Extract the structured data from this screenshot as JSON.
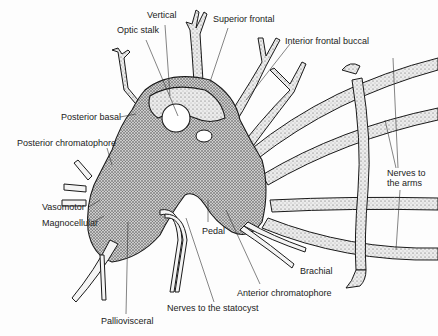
{
  "diagram": {
    "colors": {
      "ink": "#1a1a1a",
      "fill": "#d8d8d8",
      "nerve_fill": "#e6e6e6",
      "background": "#fdfdfd"
    },
    "labels": [
      {
        "id": "vertical",
        "text": "Vertical",
        "x": 147,
        "y": 15
      },
      {
        "id": "superior-frontal",
        "text": "Superior frontal",
        "x": 213,
        "y": 19
      },
      {
        "id": "optic-stalk",
        "text": "Optic stalk",
        "x": 117,
        "y": 30
      },
      {
        "id": "interior-frontal-buccal",
        "text": "Interior frontal buccal",
        "x": 285,
        "y": 37
      },
      {
        "id": "posterior-basal",
        "text": "Posterior basal",
        "x": 61,
        "y": 113
      },
      {
        "id": "posterior-chromatophore",
        "text": "Posterior chromatophore",
        "x": 17,
        "y": 138
      },
      {
        "id": "nerves-to-the-arms",
        "text": "Nerves to\nthe arms",
        "x": 387,
        "y": 168
      },
      {
        "id": "vasomotor",
        "text": "Vasomotor",
        "x": 42,
        "y": 204
      },
      {
        "id": "magnocellular",
        "text": "Magnocellular",
        "x": 42,
        "y": 219
      },
      {
        "id": "pedal",
        "text": "Pedal",
        "x": 202,
        "y": 225
      },
      {
        "id": "brachial",
        "text": "Brachial",
        "x": 300,
        "y": 266
      },
      {
        "id": "anterior-chromatophore",
        "text": "Anterior chromatophore",
        "x": 237,
        "y": 288
      },
      {
        "id": "nerves-to-the-statocyst",
        "text": "Nerves to the statocyst",
        "x": 167,
        "y": 305
      },
      {
        "id": "palliovisceral",
        "text": "Palliovisceral",
        "x": 101,
        "y": 316
      }
    ]
  }
}
